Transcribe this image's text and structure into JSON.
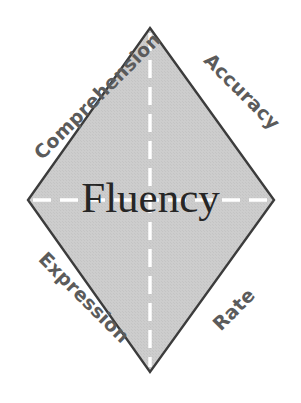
{
  "diagram": {
    "title": "Fluency",
    "type": "diamond-concept-diagram",
    "center": {
      "label": "Fluency"
    },
    "edges": [
      {
        "id": "comprehension",
        "label": "Comprehension",
        "position": "upper-left",
        "rotation_deg": -45
      },
      {
        "id": "accuracy",
        "label": "Accuracy",
        "position": "upper-right",
        "rotation_deg": 45
      },
      {
        "id": "expression",
        "label": "Expression",
        "position": "lower-left",
        "rotation_deg": 45
      },
      {
        "id": "rate",
        "label": "Rate",
        "position": "lower-right",
        "rotation_deg": -45
      }
    ],
    "colors": {
      "background": "#ffffff",
      "diamond_fill": "#cbcbcb",
      "diamond_stroke": "#3c3c3c",
      "dashed_line": "#ffffff",
      "edge_label_text": "#5b5b5b",
      "center_text": "#262626"
    },
    "geometry": {
      "top_vertex": "150,28",
      "right_vertex": "274,200",
      "bottom_vertex": "150,372",
      "left_vertex": "28,200"
    },
    "guides": {
      "vertical_dashed": "top vertex to bottom vertex",
      "horizontal_dashed": "left vertex to right vertex",
      "dash_pattern": "18 9"
    }
  }
}
